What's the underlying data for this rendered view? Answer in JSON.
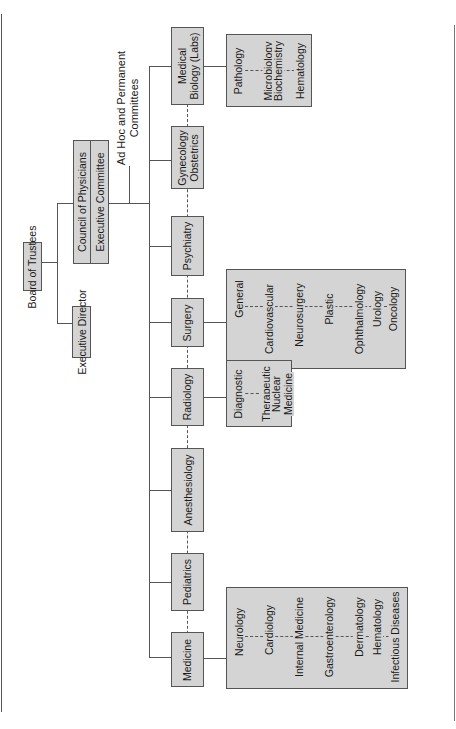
{
  "chart": {
    "orientation": "rotated-90-ccw",
    "top": {
      "board": "Board of Trustees",
      "executive_director": "Executive Director",
      "council": "Council of Physicians",
      "executive_committee": "Executive Committee",
      "committees_line1": "Ad Hoc and Permanent",
      "committees_line2": "Committees"
    },
    "departments": [
      {
        "name": "Medicine",
        "subs": [
          "Neurology",
          "Cardiology",
          "Internal Medicine",
          "Gastroenterology",
          "Dermatology",
          "Hematology",
          "Infectious Diseases"
        ]
      },
      {
        "name": "Pediatrics",
        "subs": []
      },
      {
        "name": "Anesthesiology",
        "subs": []
      },
      {
        "name": "Radiology",
        "subs": [
          "Diagnostic",
          "Therapeutic",
          "Nuclear Medicine"
        ]
      },
      {
        "name": "Surgery",
        "subs": [
          "General",
          "Cardiovascular",
          "Neurosurgery",
          "Plastic",
          "Ophthalmology",
          "Urology",
          "Oncology"
        ]
      },
      {
        "name": "Psychiatry",
        "subs": []
      },
      {
        "name_line1": "Gynecology",
        "name_line2": "Obstetrics",
        "subs": []
      },
      {
        "name_line1": "Medical",
        "name_line2": "Biology (Labs)",
        "subs": [
          "Pathology",
          "Microbiology",
          "Biochemistry",
          "Hematology"
        ]
      }
    ],
    "radiology_sub_labels": {
      "nuclear_line1": "Nuclear",
      "nuclear_line2": "Medicine"
    },
    "colors": {
      "box_fill": "#d4d4d4",
      "line": "#555555",
      "background": "#ffffff"
    }
  }
}
